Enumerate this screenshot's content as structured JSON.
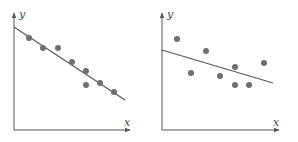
{
  "chart_data": [
    {
      "type": "scatter",
      "title": "",
      "xlabel": "x",
      "ylabel": "y",
      "grid": false,
      "legend": null,
      "description": "Strong negative linear correlation: points lie close to the fitted line",
      "axes_origin": [
        14,
        130
      ],
      "regression_line": {
        "x1": 14,
        "y1": 27,
        "x2": 125,
        "y2": 100
      },
      "points": [
        {
          "x": 29,
          "y": 38
        },
        {
          "x": 43,
          "y": 48
        },
        {
          "x": 58,
          "y": 48
        },
        {
          "x": 72,
          "y": 62
        },
        {
          "x": 86,
          "y": 71
        },
        {
          "x": 86,
          "y": 85
        },
        {
          "x": 100,
          "y": 83
        },
        {
          "x": 114,
          "y": 92
        }
      ]
    },
    {
      "type": "scatter",
      "title": "",
      "xlabel": "x",
      "ylabel": "y",
      "grid": false,
      "legend": null,
      "description": "Weak negative linear correlation: points widely scattered around the fitted line",
      "axes_origin": [
        162,
        130
      ],
      "regression_line": {
        "x1": 162,
        "y1": 50,
        "x2": 273,
        "y2": 83
      },
      "points": [
        {
          "x": 177,
          "y": 39
        },
        {
          "x": 191,
          "y": 73
        },
        {
          "x": 206,
          "y": 51
        },
        {
          "x": 220,
          "y": 76
        },
        {
          "x": 235,
          "y": 67
        },
        {
          "x": 235,
          "y": 85
        },
        {
          "x": 249,
          "y": 85
        },
        {
          "x": 264,
          "y": 63
        }
      ]
    }
  ],
  "charts": [
    {
      "x_label": "x",
      "y_label": "y"
    },
    {
      "x_label": "x",
      "y_label": "y"
    }
  ],
  "colors": {
    "axis": "#555555",
    "point": "#6e6e6e",
    "line": "#5a5a5a"
  }
}
